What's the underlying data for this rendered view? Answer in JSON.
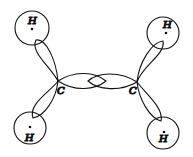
{
  "diagram": {
    "title": "",
    "atoms": [
      {
        "id": "H1",
        "label": "H",
        "type": "hydrogen"
      },
      {
        "id": "H2",
        "label": "H",
        "type": "hydrogen"
      },
      {
        "id": "H3",
        "label": "H",
        "type": "hydrogen"
      },
      {
        "id": "H4",
        "label": "H",
        "type": "hydrogen"
      },
      {
        "id": "C1",
        "label": "C",
        "type": "carbon"
      },
      {
        "id": "C2",
        "label": "C",
        "type": "carbon"
      }
    ],
    "bonds": [
      {
        "from": "C1",
        "to": "H1",
        "type": "sigma"
      },
      {
        "from": "C1",
        "to": "H3",
        "type": "sigma"
      },
      {
        "from": "C2",
        "to": "H2",
        "type": "sigma"
      },
      {
        "from": "C2",
        "to": "H4",
        "type": "sigma"
      },
      {
        "from": "C1",
        "to": "C2",
        "type": "sigma-overlap"
      }
    ],
    "colors": {
      "stroke": "#111111",
      "background": "#ffffff"
    }
  }
}
